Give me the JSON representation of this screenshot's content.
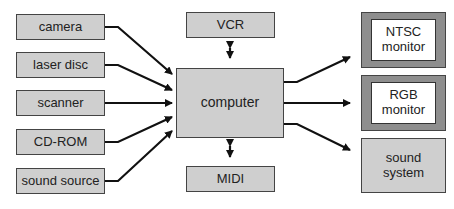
{
  "diagram": {
    "inputs": [
      {
        "id": "camera",
        "label": "camera"
      },
      {
        "id": "laser-disc",
        "label": "laser disc"
      },
      {
        "id": "scanner",
        "label": "scanner"
      },
      {
        "id": "cd-rom",
        "label": "CD-ROM"
      },
      {
        "id": "sound-source",
        "label": "sound source"
      }
    ],
    "center": {
      "label": "computer"
    },
    "bidirectional": [
      {
        "id": "vcr",
        "label": "VCR",
        "position": "above"
      },
      {
        "id": "midi",
        "label": "MIDI",
        "position": "below"
      }
    ],
    "outputs": [
      {
        "id": "ntsc-monitor",
        "label": "NTSC\nmonitor",
        "style": "monitor"
      },
      {
        "id": "rgb-monitor",
        "label": "RGB\nmonitor",
        "style": "monitor"
      },
      {
        "id": "sound-system",
        "label": "sound\nsystem",
        "style": "box"
      }
    ],
    "connections": [
      {
        "from": "camera",
        "to": "computer",
        "type": "arrow"
      },
      {
        "from": "laser-disc",
        "to": "computer",
        "type": "arrow"
      },
      {
        "from": "scanner",
        "to": "computer",
        "type": "arrow"
      },
      {
        "from": "cd-rom",
        "to": "computer",
        "type": "arrow"
      },
      {
        "from": "sound-source",
        "to": "computer",
        "type": "arrow"
      },
      {
        "from": "computer",
        "to": "vcr",
        "type": "double-arrow"
      },
      {
        "from": "computer",
        "to": "midi",
        "type": "double-arrow"
      },
      {
        "from": "computer",
        "to": "ntsc-monitor",
        "type": "arrow"
      },
      {
        "from": "computer",
        "to": "rgb-monitor",
        "type": "arrow"
      },
      {
        "from": "computer",
        "to": "sound-system",
        "type": "arrow"
      }
    ],
    "colors": {
      "box_fill": "#cfcfcf",
      "monitor_bezel": "#8e8e8e",
      "screen_fill": "#ffffff",
      "line": "#111111"
    }
  }
}
